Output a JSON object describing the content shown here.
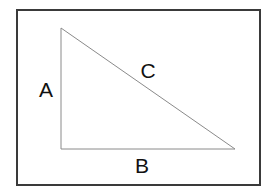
{
  "diagram": {
    "type": "right-triangle",
    "frame": {
      "x": 17,
      "y": 10,
      "width": 243,
      "height": 175,
      "stroke": "#3a3a3a",
      "stroke_width": 2
    },
    "triangle": {
      "vertices": {
        "top": [
          61,
          28
        ],
        "right_angle": [
          61,
          149
        ],
        "bottom_right": [
          235,
          149
        ]
      },
      "stroke": "#8a8a8a",
      "stroke_width": 1
    },
    "sides": [
      {
        "name": "A",
        "label": "A",
        "description": "vertical leg",
        "label_pos": [
          46,
          97
        ]
      },
      {
        "name": "B",
        "label": "B",
        "description": "horizontal leg",
        "label_pos": [
          142,
          171
        ]
      },
      {
        "name": "C",
        "label": "C",
        "description": "hypotenuse",
        "label_pos": [
          148,
          78
        ]
      }
    ]
  }
}
